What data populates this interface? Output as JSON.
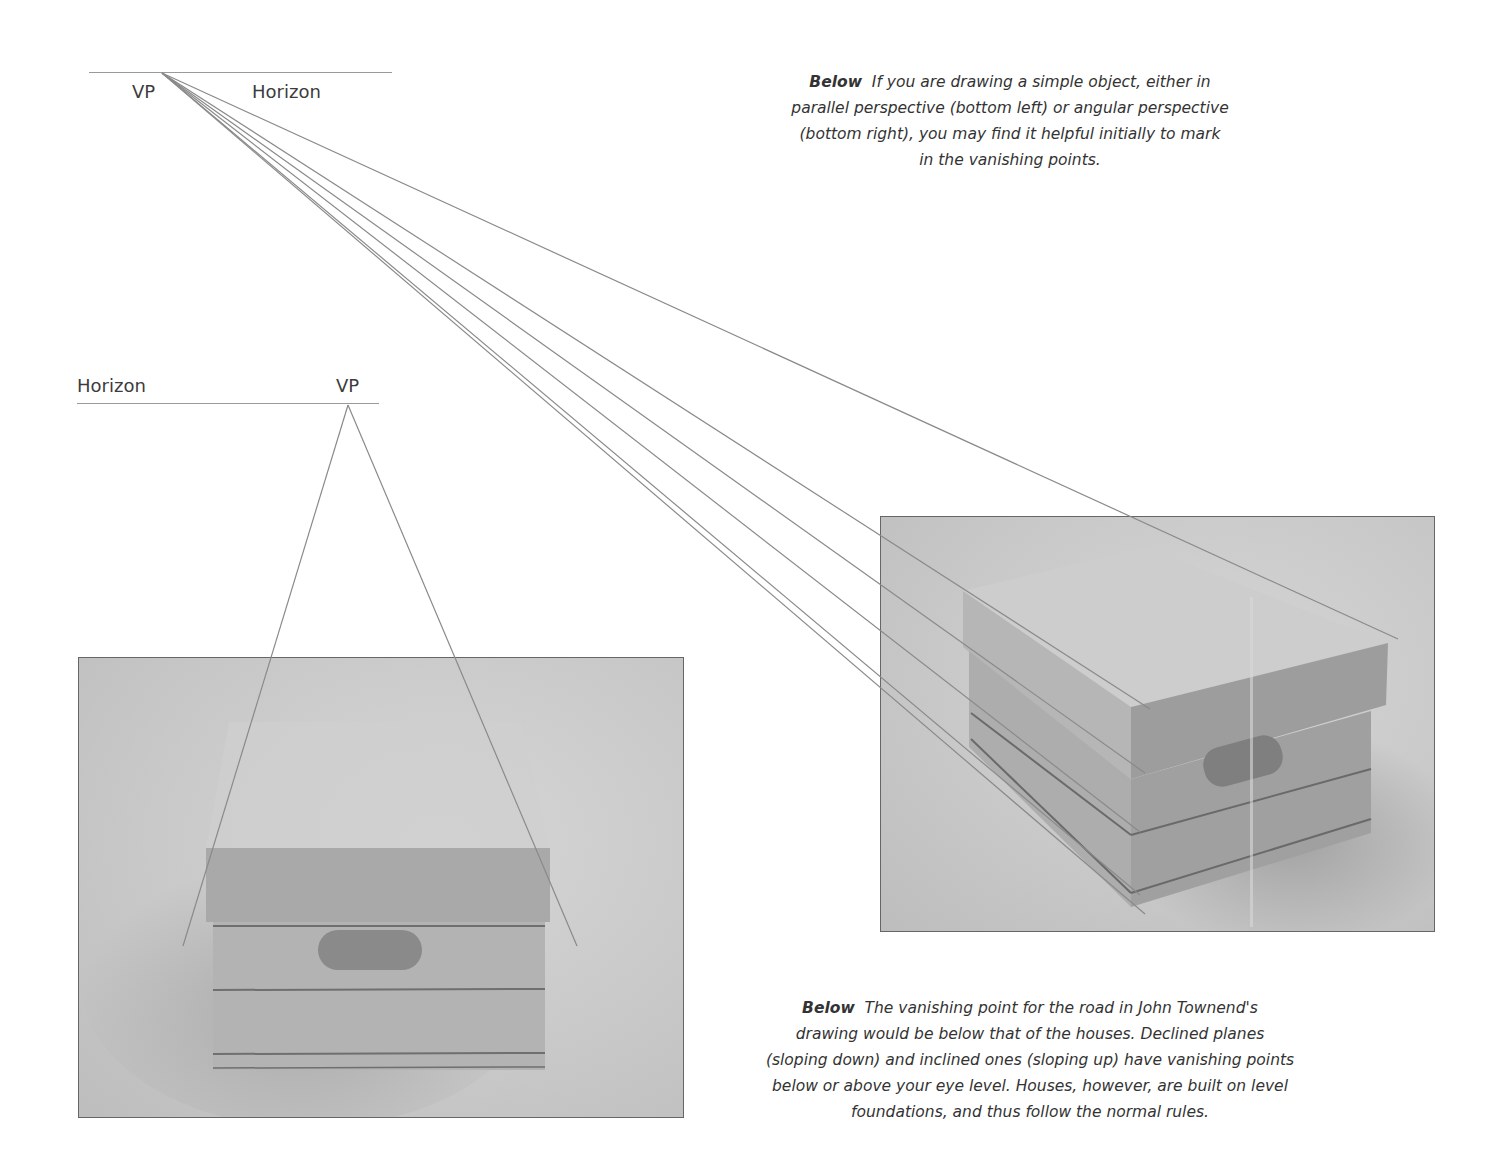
{
  "diagram_top": {
    "vp_label": "VP",
    "horizon_label": "Horizon",
    "type": "angular perspective"
  },
  "diagram_left": {
    "vp_label": "VP",
    "horizon_label": "Horizon",
    "type": "parallel perspective"
  },
  "caption_top": {
    "lead": "Below",
    "text": "If you are drawing a simple object, either in parallel perspective (bottom left) or angular perspective (bottom right), you may find it helpful initially to mark in the vanishing points.",
    "lines": [
      "If you are drawing a simple object, either in",
      "parallel perspective (bottom left) or angular perspective",
      "(bottom right), you may find it helpful initially to mark",
      "in the vanishing points."
    ]
  },
  "caption_bottom": {
    "lead": "Below",
    "text": "The vanishing point for the road in John Townend's drawing would be below that of the houses. Declined planes (sloping down) and inclined ones (sloping up) have vanishing points below or above your eye level. Houses, however, are built on level foundations, and thus follow the normal rules.",
    "lines": [
      "The vanishing point for the road in John Townend's",
      "drawing would be below that of the houses. Declined planes",
      "(sloping down) and inclined ones (sloping up) have vanishing points",
      "below or above your eye level. Houses, however, are built on level",
      "foundations, and thus follow the normal rules."
    ]
  },
  "photos": {
    "left": {
      "subject": "storage box, front view",
      "alt": "Photo of a lidded storage box in parallel perspective"
    },
    "right": {
      "subject": "storage box, angled view",
      "alt": "Photo of a lidded storage box in angular perspective"
    }
  },
  "colors": {
    "line": "#8a8a8a",
    "horizon": "#9a9a9a",
    "text": "#333333",
    "photo_bg": "#c8c8c8",
    "box_dark": "#9a9a9a",
    "box_mid": "#acacac",
    "box_light": "#bdbdbd"
  }
}
